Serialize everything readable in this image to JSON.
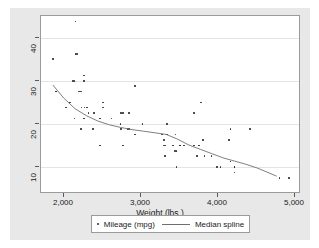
{
  "chart_data": {
    "type": "scatter",
    "title": "",
    "xlabel": "Weight (lbs.)",
    "ylabel": "",
    "xlim": [
      1600,
      5000
    ],
    "ylim": [
      9,
      42
    ],
    "xticks": [
      2000,
      3000,
      4000,
      5000
    ],
    "xtick_labels": [
      "2,000",
      "3,000",
      "4,000",
      "5,000"
    ],
    "yticks": [
      10,
      20,
      30,
      40
    ],
    "ytick_labels": [
      "10",
      "20",
      "30",
      "40"
    ],
    "grid": "horizontal",
    "legend_position": "bottom",
    "series": [
      {
        "name": "Mileage (mpg)",
        "type": "scatter",
        "marker": "dot",
        "color": "#2b2b2b",
        "points": [
          [
            2930,
            22
          ],
          [
            3350,
            17
          ],
          [
            2640,
            22
          ],
          [
            3250,
            20
          ],
          [
            4080,
            15
          ],
          [
            3670,
            18
          ],
          [
            3690,
            26
          ],
          [
            3180,
            20
          ],
          [
            3220,
            16
          ],
          [
            4060,
            19
          ],
          [
            3600,
            24
          ],
          [
            3600,
            18
          ],
          [
            3740,
            16
          ],
          [
            4130,
            14
          ],
          [
            4130,
            14
          ],
          [
            4080,
            21
          ],
          [
            3720,
            19
          ],
          [
            3370,
            17
          ],
          [
            4130,
            13
          ],
          [
            2830,
            29
          ],
          [
            2100,
            28
          ],
          [
            2650,
            21
          ],
          [
            3250,
            22
          ],
          [
            4080,
            15
          ],
          [
            3950,
            14
          ],
          [
            3470,
            18
          ],
          [
            3210,
            19
          ],
          [
            2750,
            24
          ],
          [
            3200,
            18
          ],
          [
            3900,
            14
          ],
          [
            2410,
            26
          ],
          [
            3420,
            18
          ],
          [
            2830,
            20
          ],
          [
            3420,
            18
          ],
          [
            2200,
            25
          ],
          [
            3330,
            18
          ],
          [
            3220,
            18
          ],
          [
            3640,
            16
          ],
          [
            4720,
            12
          ],
          [
            3830,
            16
          ],
          [
            2040,
            30
          ],
          [
            3370,
            14
          ],
          [
            2730,
            21
          ],
          [
            2370,
            18
          ],
          [
            1800,
            28
          ],
          [
            1800,
            28
          ],
          [
            4330,
            21
          ],
          [
            1760,
            34
          ],
          [
            2050,
            35
          ],
          [
            2410,
            25
          ],
          [
            2520,
            23
          ],
          [
            3360,
            20
          ],
          [
            2290,
            24
          ],
          [
            2280,
            21
          ],
          [
            2170,
            25
          ],
          [
            2670,
            24
          ],
          [
            2070,
            35
          ],
          [
            2650,
            24
          ],
          [
            1930,
            25
          ],
          [
            2120,
            28
          ],
          [
            2160,
            30
          ],
          [
            2020,
            30
          ],
          [
            2050,
            41
          ],
          [
            2130,
            25
          ],
          [
            1980,
            26
          ],
          [
            2160,
            31
          ],
          [
            2040,
            23
          ],
          [
            2160,
            23
          ],
          [
            2370,
            23
          ],
          [
            2220,
            24
          ],
          [
            2750,
            21
          ],
          [
            2120,
            21
          ],
          [
            2670,
            18
          ],
          [
            4840,
            12
          ]
        ]
      },
      {
        "name": "Median spline",
        "type": "line",
        "color": "#6f6f6f",
        "points": [
          [
            1760,
            29.0
          ],
          [
            1900,
            26.6
          ],
          [
            2050,
            24.6
          ],
          [
            2200,
            23.3
          ],
          [
            2350,
            22.3
          ],
          [
            2500,
            21.6
          ],
          [
            2650,
            21.1
          ],
          [
            2800,
            20.7
          ],
          [
            2950,
            20.4
          ],
          [
            3100,
            20.1
          ],
          [
            3250,
            19.8
          ],
          [
            3400,
            18.9
          ],
          [
            3550,
            17.8
          ],
          [
            3700,
            17.0
          ],
          [
            3850,
            16.2
          ],
          [
            4000,
            15.4
          ],
          [
            4150,
            14.8
          ],
          [
            4300,
            14.2
          ],
          [
            4450,
            13.5
          ],
          [
            4700,
            12.0
          ]
        ]
      }
    ]
  },
  "legend": {
    "entries": [
      {
        "label": "Mileage (mpg)",
        "marker": "dot"
      },
      {
        "label": "Median spline",
        "marker": "line"
      }
    ]
  },
  "colors": {
    "graph_background": "#e8e8e8",
    "plot_background": "#ffffff",
    "marker": "#2b2b2b",
    "spline": "#6f6f6f",
    "gridline": "#e4e4e4",
    "axis": "#9a9a9a"
  }
}
